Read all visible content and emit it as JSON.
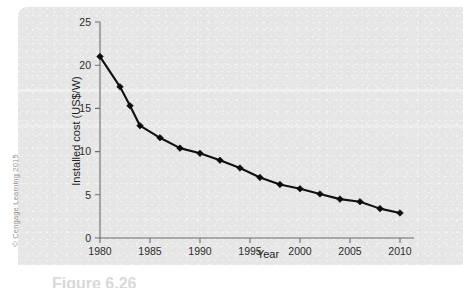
{
  "figure": {
    "credit": "© Cengage Learning 2015",
    "caption": "Figure 6.26",
    "panel_color": "#e6e6e6",
    "page_color": "#ffffff"
  },
  "chart_data": {
    "type": "line",
    "title": "",
    "subtitle": "",
    "xlabel": "Year",
    "ylabel": "Installed cost (US$/W)",
    "xlim": [
      1980,
      2010
    ],
    "ylim": [
      0,
      25
    ],
    "xticks": [
      1980,
      1985,
      1990,
      1995,
      2000,
      2005,
      2010
    ],
    "xtick_labels": [
      "1980",
      "1985",
      "1990",
      "1995",
      "2000",
      "2005",
      "2010"
    ],
    "yticks": [
      0,
      5,
      10,
      15,
      20,
      25
    ],
    "ytick_labels": [
      "0",
      "5",
      "10",
      "15",
      "20",
      "25"
    ],
    "grid": false,
    "legend": null,
    "legend_position": "none",
    "marker": "diamond",
    "line_color": "#111111",
    "marker_color": "#0c0c0c",
    "x": [
      1980,
      1982,
      1983,
      1984,
      1986,
      1988,
      1990,
      1992,
      1994,
      1996,
      1998,
      2000,
      2002,
      2004,
      2006,
      2008,
      2010
    ],
    "y": [
      21.0,
      17.5,
      15.3,
      13.0,
      11.6,
      10.4,
      9.8,
      9.0,
      8.1,
      7.0,
      6.2,
      5.7,
      5.1,
      4.5,
      4.2,
      3.4,
      2.9
    ],
    "series": [
      {
        "name": "Installed cost",
        "x": [
          1980,
          1982,
          1983,
          1984,
          1986,
          1988,
          1990,
          1992,
          1994,
          1996,
          1998,
          2000,
          2002,
          2004,
          2006,
          2008,
          2010
        ],
        "values": [
          21.0,
          17.5,
          15.3,
          13.0,
          11.6,
          10.4,
          9.8,
          9.0,
          8.1,
          7.0,
          6.2,
          5.7,
          5.1,
          4.5,
          4.2,
          3.4,
          2.9
        ]
      }
    ],
    "annotations": []
  }
}
